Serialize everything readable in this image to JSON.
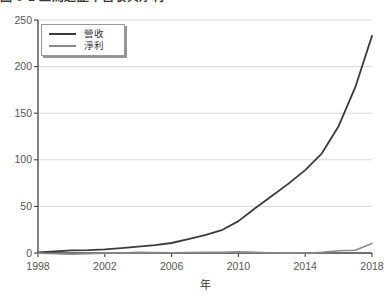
{
  "caption": {
    "text": "圖 0-1 亞馬遜歷年營收與淨利"
  },
  "chart_data": {
    "type": "line",
    "title": "",
    "xlabel": "年",
    "ylabel": "",
    "xlim": [
      1998,
      2018
    ],
    "ylim": [
      0,
      250
    ],
    "xticks": [
      1998,
      2002,
      2006,
      2010,
      2014,
      2018
    ],
    "yticks": [
      0,
      50,
      100,
      150,
      200,
      250
    ],
    "grid": "horizontal",
    "legend_position": "top-left",
    "x": [
      1998,
      1999,
      2000,
      2001,
      2002,
      2003,
      2004,
      2005,
      2006,
      2007,
      2008,
      2009,
      2010,
      2011,
      2012,
      2013,
      2014,
      2015,
      2016,
      2017,
      2018
    ],
    "series": [
      {
        "name": "營收",
        "slug": "revenue",
        "color": "#3b3b3b",
        "width": 1.8,
        "values": [
          0.6,
          1.6,
          2.8,
          3.1,
          3.9,
          5.3,
          6.9,
          8.5,
          10.7,
          14.8,
          19.2,
          24.5,
          34.2,
          48.1,
          61.1,
          74.5,
          89.0,
          107.0,
          136.0,
          177.9,
          232.9
        ]
      },
      {
        "name": "淨利",
        "slug": "net-profit",
        "color": "#8a8a8a",
        "width": 1.6,
        "values": [
          -0.1,
          -0.7,
          -1.4,
          -0.6,
          -0.1,
          0.0,
          0.6,
          0.4,
          0.2,
          0.5,
          0.6,
          0.9,
          1.2,
          0.6,
          0.0,
          0.3,
          -0.2,
          0.6,
          2.4,
          3.0,
          10.1
        ]
      }
    ],
    "colors": {
      "axis": "#3f3f3f",
      "grid": "#d8d8d8",
      "tick_label": "#565656",
      "background": "#ffffff"
    }
  }
}
